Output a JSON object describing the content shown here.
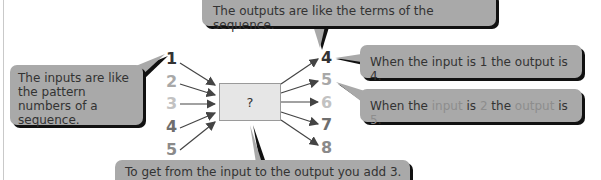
{
  "diagram": {
    "function_box": {
      "label": "?"
    },
    "inputs": [
      {
        "value": "1",
        "color": "#333333"
      },
      {
        "value": "2",
        "color": "#a8a8a8"
      },
      {
        "value": "3",
        "color": "#c2c2c2"
      },
      {
        "value": "4",
        "color": "#6e6e6e"
      },
      {
        "value": "5",
        "color": "#8a8a8a"
      }
    ],
    "outputs": [
      {
        "value": "4",
        "color": "#333333"
      },
      {
        "value": "5",
        "color": "#a8a8a8"
      },
      {
        "value": "6",
        "color": "#c2c2c2"
      },
      {
        "value": "7",
        "color": "#6e6e6e"
      },
      {
        "value": "8",
        "color": "#8a8a8a"
      }
    ]
  },
  "callouts": {
    "inputs_note": "The inputs are like the pattern numbers of a sequence.",
    "outputs_note": "The outputs are like the terms of the sequence.",
    "example_1": "When the input is 1 the output is 4.",
    "example_2": {
      "part1": "When the ",
      "input_word": "input",
      "part2": " is ",
      "input_value": "2",
      "part3": " the ",
      "output_word": "output",
      "part4": " is ",
      "output_value": "5",
      "part5": "."
    },
    "rule_note": "To get from the input to the output you add 3."
  },
  "colors": {
    "bubble": "#a9a9a9",
    "bubble_shadow": "#111111",
    "box_fill": "#e6e6e6",
    "arrow": "#444444"
  }
}
